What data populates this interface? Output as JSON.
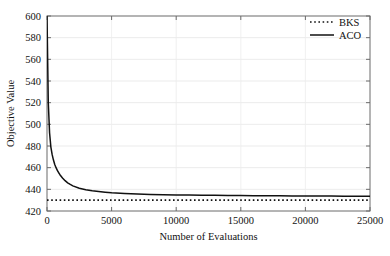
{
  "chart_data": {
    "type": "line",
    "title": "",
    "xlabel": "Number of Evaluations",
    "ylabel": "Objective Value",
    "xlim": [
      0,
      25000
    ],
    "ylim": [
      420,
      600
    ],
    "xticks": [
      0,
      5000,
      10000,
      15000,
      20000,
      25000
    ],
    "yticks": [
      420,
      440,
      460,
      480,
      500,
      520,
      540,
      560,
      580,
      600
    ],
    "xtick_labels": [
      "0",
      "5000",
      "10000",
      "15000",
      "20000",
      "25000"
    ],
    "ytick_labels": [
      "420",
      "440",
      "460",
      "480",
      "500",
      "520",
      "540",
      "560",
      "580",
      "600"
    ],
    "grid": true,
    "legend_position": "upper right",
    "series": [
      {
        "name": "BKS",
        "style": "dotted",
        "color": "#111111",
        "description": "Best known solution reference line",
        "constant_value": 430,
        "x": [
          0,
          25000
        ],
        "values": [
          430,
          430
        ]
      },
      {
        "name": "ACO",
        "style": "solid",
        "color": "#111111",
        "description": "Ant colony optimization convergence curve",
        "x": [
          0,
          100,
          200,
          300,
          400,
          500,
          600,
          700,
          800,
          900,
          1000,
          1200,
          1400,
          1600,
          1800,
          2000,
          2500,
          3000,
          3500,
          4000,
          4500,
          5000,
          6000,
          7000,
          8000,
          9000,
          10000,
          11000,
          12000,
          13000,
          14000,
          15000,
          16000,
          17000,
          18000,
          19000,
          20000,
          21000,
          22000,
          23000,
          24000,
          25000
        ],
        "values": [
          600,
          520,
          492,
          479,
          472,
          467,
          463,
          460,
          457.5,
          455.5,
          453.5,
          450.5,
          448,
          446,
          444.5,
          443.2,
          441,
          439.6,
          438.6,
          437.9,
          437.3,
          436.8,
          436.1,
          435.6,
          435.3,
          435.05,
          434.85,
          434.7,
          434.55,
          434.45,
          434.35,
          434.25,
          434.15,
          434.08,
          434.0,
          433.93,
          433.86,
          433.8,
          433.74,
          433.68,
          433.62,
          433.55
        ]
      }
    ]
  },
  "legend": {
    "entries": [
      {
        "label": "BKS",
        "style": "dotted"
      },
      {
        "label": "ACO",
        "style": "solid"
      }
    ]
  }
}
